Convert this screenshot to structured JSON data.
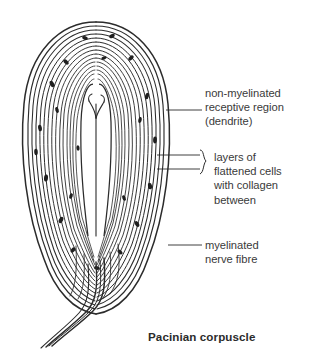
{
  "figure": {
    "title": "Pacinian corpuscle",
    "background_color": "#ffffff",
    "ink_color": "#2b2b2b",
    "text_color": "#3a3a3a"
  },
  "labels": {
    "dendrite": "non-myelinated\nreceptive region\n(dendrite)",
    "layers": "layers of\nflattened cells\nwith collagen\nbetween",
    "fibre": "myelinated\nnerve fibre"
  },
  "diagram": {
    "parts": [
      {
        "name": "non-myelinated receptive region (dendrite)",
        "leader_line": {
          "x1": 166,
          "y1": 110,
          "x2": 202,
          "y2": 110
        }
      },
      {
        "name": "layers of flattened cells with collagen between",
        "leader_lines": [
          {
            "x1": 157,
            "y1": 155,
            "x2": 200,
            "y2": 155
          },
          {
            "x1": 157,
            "y1": 169,
            "x2": 200,
            "y2": 169
          }
        ],
        "brace": {
          "x": 205,
          "y_top": 148,
          "y_bottom": 176
        }
      },
      {
        "name": "myelinated nerve fibre",
        "leader_line": {
          "x1": 168,
          "y1": 245,
          "x2": 202,
          "y2": 245
        }
      }
    ],
    "lamellae_count": 15,
    "nuclei_visible": true
  }
}
